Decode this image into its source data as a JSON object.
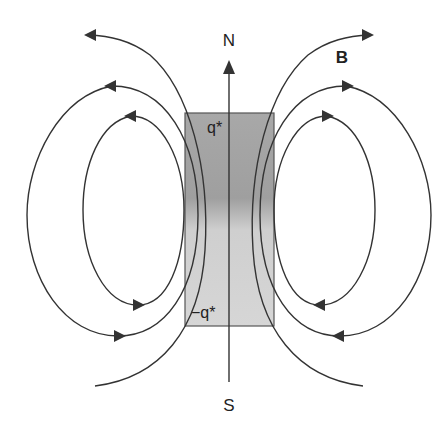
{
  "diagram": {
    "labels": {
      "north": "N",
      "south": "S",
      "field": "B",
      "top_charge": "q*",
      "bottom_charge": "−q*"
    },
    "magnet": {
      "x": 185,
      "y": 113,
      "width": 89,
      "height": 213,
      "top_color": "#a9a9a9",
      "bottom_color": "#d4d4d4",
      "border_color": "#555555"
    },
    "axis": {
      "x": 229,
      "top": 62,
      "bottom": 382
    },
    "colors": {
      "line": "#333333",
      "background": "#ffffff"
    }
  }
}
